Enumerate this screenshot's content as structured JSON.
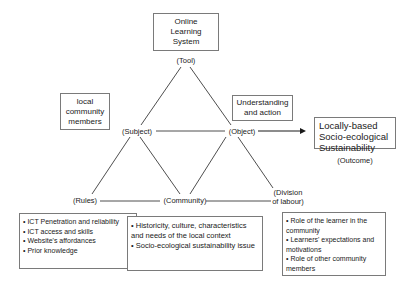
{
  "diagram": {
    "tool": {
      "box_lines": [
        "Online",
        "Learning",
        "System"
      ],
      "label": "(Tool)"
    },
    "subject": {
      "box_lines": [
        "local",
        "community",
        "members"
      ],
      "label": "(Subject)"
    },
    "object": {
      "box_lines": [
        "Understanding",
        "and action"
      ],
      "label": "(Object)"
    },
    "outcome": {
      "box_lines": [
        "Locally-based",
        "Socio-ecological",
        "Sustainability"
      ],
      "label": "(Outcome)"
    },
    "rules": {
      "label": "(Rules)",
      "items": [
        "• ICT Penetration and reliability",
        "• ICT access and skills",
        "• Website's affordances",
        "• Prior knowledge"
      ]
    },
    "community": {
      "label": "(Community)",
      "items": [
        "• Historicity, culture, characteristics and needs of the local context",
        "• Socio-ecological sustainability issue"
      ]
    },
    "division": {
      "label_lines": [
        "(Division",
        "of labour)"
      ],
      "items": [
        "• Role of the learner in the community",
        "• Learners' expectations and motivations",
        "• Role of other community members"
      ]
    },
    "colors": {
      "line": "#3a3a3a",
      "box_border": "#7a7a7a"
    }
  }
}
